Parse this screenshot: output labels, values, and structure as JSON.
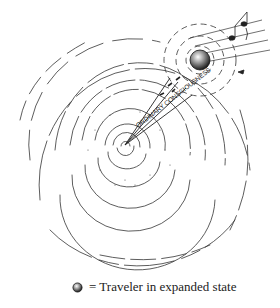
{
  "illustration": {
    "title": "Spiral of consciousness with traveler",
    "label_beam": "ORDINARY CONSCIOUSNESS",
    "center": [
      125,
      145
    ],
    "traveler_position": [
      200,
      60
    ],
    "ink_color": "#2a2a2a"
  },
  "legend": {
    "icon": "traveler-sphere-icon",
    "text": "= Traveler in expanded state"
  }
}
